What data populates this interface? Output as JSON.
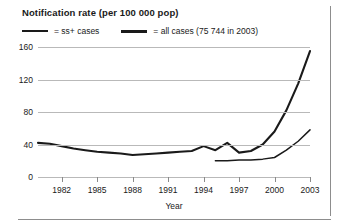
{
  "chart_data": {
    "type": "line",
    "title": "Notification rate (per 100 000 pop)",
    "xlabel": "Year",
    "ylabel": "",
    "xlim": [
      1980,
      2003
    ],
    "ylim": [
      0,
      160
    ],
    "grid": true,
    "legend_position": "top-left",
    "y_ticks": [
      0,
      40,
      80,
      120,
      160
    ],
    "x_ticks": [
      1982,
      1985,
      1988,
      1991,
      1994,
      1997,
      2000,
      2003
    ],
    "series": [
      {
        "name": "ss+ cases",
        "legend_label": "= ss+ cases",
        "style": "thin",
        "color": "#1a1a1a",
        "x": [
          1995,
          1996,
          1997,
          1998,
          1999,
          2000,
          2001,
          2002,
          2003
        ],
        "values": [
          20,
          20,
          21,
          21,
          22,
          24,
          33,
          44,
          58
        ]
      },
      {
        "name": "all cases",
        "legend_label": "= all cases (75 744 in 2003)",
        "annotation": "75 744 in 2003",
        "style": "thick",
        "color": "#1a1a1a",
        "x": [
          1980,
          1981,
          1982,
          1983,
          1984,
          1985,
          1986,
          1987,
          1988,
          1989,
          1990,
          1991,
          1992,
          1993,
          1994,
          1995,
          1996,
          1997,
          1998,
          1999,
          2000,
          2001,
          2002,
          2003
        ],
        "values": [
          42,
          41,
          38,
          35,
          33,
          31,
          30,
          29,
          27,
          28,
          29,
          30,
          31,
          32,
          38,
          33,
          42,
          30,
          32,
          40,
          56,
          82,
          115,
          155
        ]
      }
    ]
  }
}
